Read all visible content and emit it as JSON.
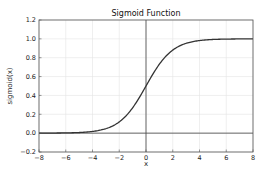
{
  "chart_data": {
    "type": "line",
    "title": "Sigmoid Function",
    "xlabel": "x",
    "ylabel": "sigmoid(x)",
    "xlim": [
      -8,
      8
    ],
    "ylim": [
      -0.2,
      1.2
    ],
    "xticks": [
      -8,
      -6,
      -4,
      -2,
      0,
      2,
      4,
      6,
      8
    ],
    "yticks": [
      -0.2,
      0.0,
      0.2,
      0.4,
      0.6,
      0.8,
      1.0,
      1.2
    ],
    "xtick_labels": [
      "−8",
      "−6",
      "−4",
      "−2",
      "0",
      "2",
      "4",
      "6",
      "8"
    ],
    "ytick_labels": [
      "−0.2",
      "0.0",
      "0.2",
      "0.4",
      "0.6",
      "0.8",
      "1.0",
      "1.2"
    ],
    "grid": true,
    "reference_lines": {
      "horizontal_y": 0,
      "vertical_x": 0
    },
    "series": [
      {
        "name": "sigmoid",
        "function": "1/(1+exp(-x))",
        "x": [
          -8,
          -7,
          -6,
          -5,
          -4,
          -3,
          -2,
          -1,
          0,
          1,
          2,
          3,
          4,
          5,
          6,
          7,
          8
        ],
        "values": [
          0.0003,
          0.0009,
          0.0025,
          0.0067,
          0.018,
          0.047,
          0.119,
          0.269,
          0.5,
          0.731,
          0.881,
          0.953,
          0.982,
          0.993,
          0.998,
          0.999,
          0.9997
        ],
        "color": "#333333"
      }
    ],
    "legend": null
  },
  "colors": {
    "grid": "#e4e4e4",
    "frame": "#555555",
    "curve": "#333333",
    "reference": "#444444"
  }
}
